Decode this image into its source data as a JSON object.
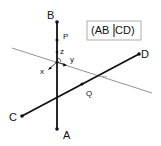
{
  "diagram": {
    "points": {
      "A": "A",
      "B": "B",
      "C": "C",
      "D": "D",
      "P": "P",
      "Q": "Q"
    },
    "axes": {
      "x": "x",
      "y": "y",
      "z": "z"
    },
    "notation_box": {
      "left": "(AB",
      "right": "CD)"
    },
    "colors": {
      "line": "#111111",
      "thin_line": "#666666",
      "box_border": "#999999"
    }
  }
}
